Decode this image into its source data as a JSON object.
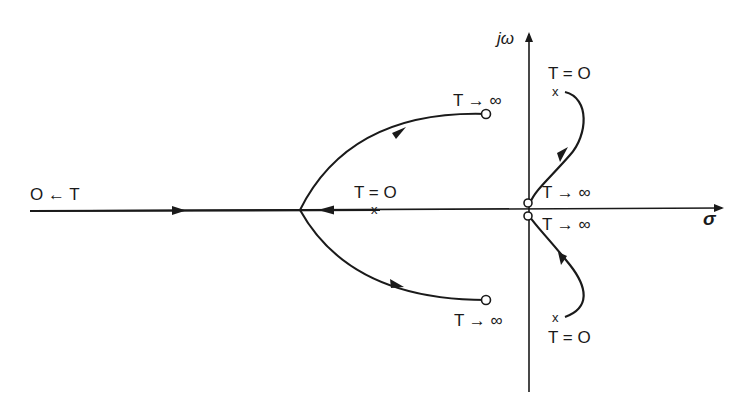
{
  "diagram": {
    "type": "root-locus",
    "axes": {
      "imag_label": "jω",
      "real_label": "σ"
    },
    "labels": {
      "left_end": "O ← T",
      "upper_branch_end": "T → ∞",
      "lower_branch_end": "T → ∞",
      "real_pole": "T = O",
      "upper_complex_pole": "T = O",
      "lower_complex_pole": "T = O",
      "upper_origin_zero": "T → ∞",
      "lower_origin_zero": "T → ∞"
    },
    "markers": {
      "pole_symbol": "x",
      "zero_symbol": "o"
    },
    "colors": {
      "ink": "#1a1a1a",
      "background": "#ffffff"
    }
  }
}
